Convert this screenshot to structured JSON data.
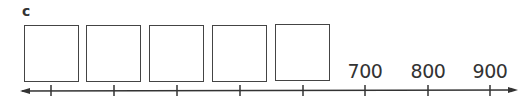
{
  "part_label": "c",
  "boxes": [
    {
      "x": 24,
      "y": 25,
      "value": ""
    },
    {
      "x": 86,
      "y": 25,
      "value": ""
    },
    {
      "x": 149,
      "y": 25,
      "value": ""
    },
    {
      "x": 212,
      "y": 25,
      "value": ""
    },
    {
      "x": 275,
      "y": 24,
      "value": ""
    }
  ],
  "number_line": {
    "ticks_x": [
      51,
      114,
      177,
      240,
      303,
      365,
      428,
      490
    ],
    "labels": [
      {
        "x": 365,
        "text": "700"
      },
      {
        "x": 428,
        "text": "800"
      },
      {
        "x": 490,
        "text": "900"
      }
    ],
    "line_color": "#333333"
  }
}
